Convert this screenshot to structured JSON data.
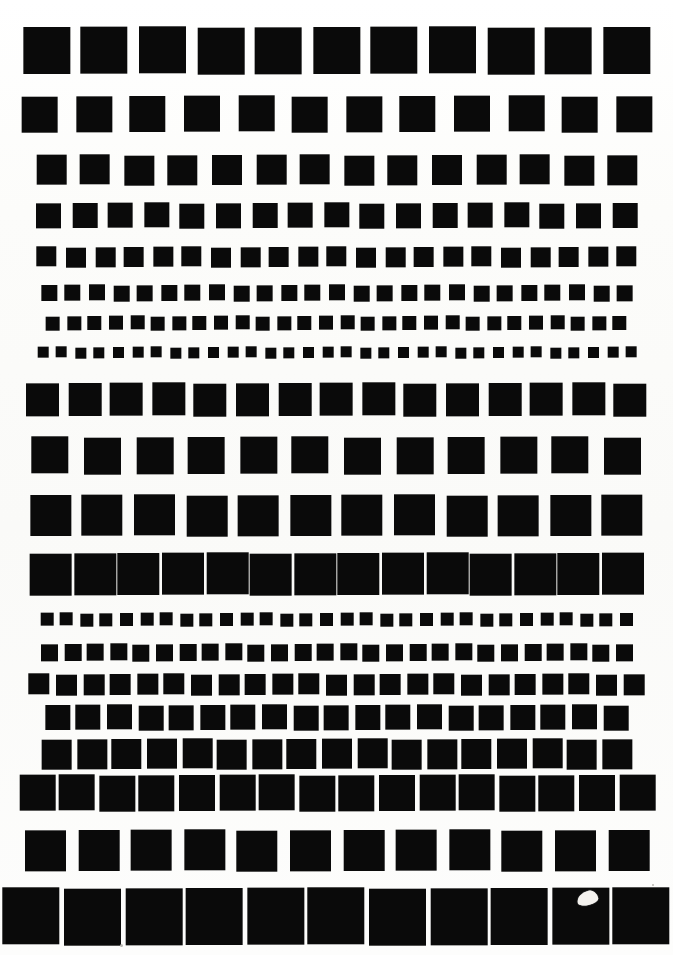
{
  "document": {
    "kind": "scanned-test-chart",
    "title": "Square patch resolution test chart",
    "page_width": 673,
    "page_height": 955,
    "background_color": "#fdfdfb",
    "patch_color": "#0a0a0a",
    "total_rows": 18
  },
  "artifacts": [
    {
      "name": "scan-blob",
      "description": "small white irregular blob over patch",
      "x": 577,
      "y": 891,
      "width": 21,
      "height": 14,
      "color": "#f4f2ee"
    },
    {
      "name": "dust-speck-1",
      "x": 120,
      "y": 944,
      "width": 3,
      "height": 3,
      "color": "#b9b7b2"
    },
    {
      "name": "dust-speck-2",
      "x": 652,
      "y": 884,
      "width": 2,
      "height": 2,
      "color": "#b9b7b2"
    }
  ],
  "chart_data": {
    "type": "table",
    "xlabel": "",
    "ylabel": "",
    "columns": [
      "row",
      "patch_size_px",
      "patch_count",
      "row_top_px",
      "gap_px"
    ],
    "rows": [
      [
        1,
        47,
        11,
        27,
        11
      ],
      [
        2,
        36,
        12,
        96,
        18
      ],
      [
        3,
        30,
        14,
        155,
        14
      ],
      [
        4,
        25,
        17,
        203,
        11
      ],
      [
        5,
        20,
        21,
        247,
        9
      ],
      [
        6,
        16,
        25,
        285,
        8
      ],
      [
        7,
        14,
        28,
        316,
        7
      ],
      [
        8,
        11,
        32,
        347,
        8
      ],
      [
        9,
        33,
        15,
        383,
        9
      ],
      [
        10,
        37,
        12,
        437,
        15
      ],
      [
        11,
        41,
        12,
        495,
        11
      ],
      [
        12,
        42,
        14,
        553,
        2
      ],
      [
        13,
        13,
        30,
        613,
        7
      ],
      [
        14,
        17,
        26,
        644,
        6
      ],
      [
        15,
        21,
        23,
        674,
        6
      ],
      [
        16,
        25,
        19,
        705,
        6
      ],
      [
        17,
        30,
        17,
        739,
        5
      ],
      [
        18,
        36,
        16,
        775,
        4
      ],
      [
        19,
        41,
        12,
        830,
        12
      ],
      [
        20,
        57,
        11,
        888,
        4
      ]
    ]
  },
  "rows": [
    {
      "index": 1,
      "size": 47,
      "count": 11,
      "top": 27,
      "gap": 11
    },
    {
      "index": 2,
      "size": 36,
      "count": 12,
      "top": 96,
      "gap": 18
    },
    {
      "index": 3,
      "size": 30,
      "count": 14,
      "top": 155,
      "gap": 14
    },
    {
      "index": 4,
      "size": 25,
      "count": 17,
      "top": 203,
      "gap": 11
    },
    {
      "index": 5,
      "size": 20,
      "count": 21,
      "top": 247,
      "gap": 9
    },
    {
      "index": 6,
      "size": 16,
      "count": 25,
      "top": 285,
      "gap": 8
    },
    {
      "index": 7,
      "size": 14,
      "count": 28,
      "top": 316,
      "gap": 7
    },
    {
      "index": 8,
      "size": 11,
      "count": 32,
      "top": 347,
      "gap": 8
    },
    {
      "index": 9,
      "size": 33,
      "count": 15,
      "top": 383,
      "gap": 9
    },
    {
      "index": 10,
      "size": 37,
      "count": 12,
      "top": 437,
      "gap": 15
    },
    {
      "index": 11,
      "size": 41,
      "count": 12,
      "top": 495,
      "gap": 11
    },
    {
      "index": 12,
      "size": 42,
      "count": 14,
      "top": 553,
      "gap": 2
    },
    {
      "index": 13,
      "size": 13,
      "count": 30,
      "top": 613,
      "gap": 7
    },
    {
      "index": 14,
      "size": 17,
      "count": 26,
      "top": 644,
      "gap": 6
    },
    {
      "index": 15,
      "size": 21,
      "count": 23,
      "top": 674,
      "gap": 6
    },
    {
      "index": 16,
      "size": 25,
      "count": 19,
      "top": 705,
      "gap": 6
    },
    {
      "index": 17,
      "size": 30,
      "count": 17,
      "top": 739,
      "gap": 5
    },
    {
      "index": 18,
      "size": 36,
      "count": 16,
      "top": 775,
      "gap": 4
    },
    {
      "index": 19,
      "size": 41,
      "count": 12,
      "top": 830,
      "gap": 12
    },
    {
      "index": 20,
      "size": 57,
      "count": 11,
      "top": 888,
      "gap": 4
    }
  ]
}
